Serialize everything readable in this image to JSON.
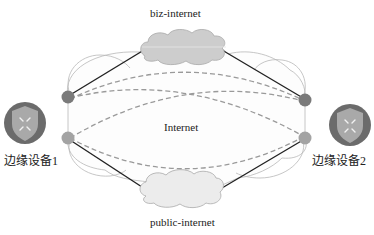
{
  "diagram": {
    "type": "network-topology",
    "networks": {
      "top": {
        "label": "biz-internet",
        "kind": "cloud"
      },
      "middle": {
        "label": "Internet",
        "kind": "cloud-region"
      },
      "bottom": {
        "label": "public-internet",
        "kind": "cloud"
      }
    },
    "devices": [
      {
        "id": "edge1",
        "label": "边缘设备1",
        "icon": "shield-router-icon",
        "side": "left"
      },
      {
        "id": "edge2",
        "label": "边缘设备2",
        "icon": "shield-router-icon",
        "side": "right"
      }
    ],
    "links": [
      {
        "from": "edge1.port-top",
        "to": "edge2.port-top",
        "via": "biz-internet",
        "style": "solid"
      },
      {
        "from": "edge1.port-bottom",
        "to": "edge2.port-bottom",
        "via": "public-internet",
        "style": "solid"
      },
      {
        "from": "edge1.port-top",
        "to": "edge2.port-top",
        "style": "dashed"
      },
      {
        "from": "edge1.port-top",
        "to": "edge2.port-bottom",
        "style": "dashed"
      },
      {
        "from": "edge1.port-bottom",
        "to": "edge2.port-top",
        "style": "dashed"
      },
      {
        "from": "edge1.port-bottom",
        "to": "edge2.port-bottom",
        "style": "dashed"
      }
    ],
    "colors": {
      "device_ring": "#6b6b6b",
      "shield": "#a9a9a9",
      "port_top": "#7a7a7a",
      "port_bottom": "#a0a0a0",
      "cloud_fill": "#cfcfcf",
      "dashed_link": "#9a9a9a",
      "solid_link": "#222222",
      "outline": "#b5b5b5"
    }
  }
}
